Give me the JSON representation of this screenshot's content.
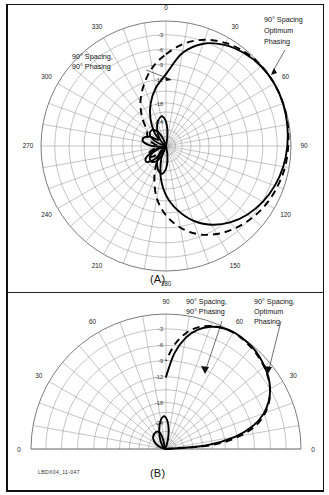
{
  "figure": {
    "id_label": "LBDX04_11-047",
    "panel_a_caption": "(A)",
    "panel_b_caption": "(B)"
  },
  "annotations": {
    "a_left_line1": "90° Spacing,",
    "a_left_line2": "90° Phasing",
    "a_right_line1": "90° Spacing",
    "a_right_line2": "Optimum",
    "a_right_line3": "Phasing",
    "b_left_line1": "90° Spacing,",
    "b_left_line2": "90° Phasing",
    "b_right_line1": "90° Spacing,",
    "b_right_line2": "Optimum",
    "b_right_line3": "Phasing"
  },
  "chart_data": [
    {
      "type": "line",
      "plot_kind": "polar-radiation-pattern",
      "panel": "(A)",
      "title": "",
      "angle_unit": "degrees",
      "angle_ticks": [
        0,
        30,
        60,
        90,
        120,
        150,
        180,
        210,
        240,
        270,
        300,
        330
      ],
      "angle_tick_labels": [
        "0",
        "30",
        "60",
        "90",
        "120",
        "150",
        "180",
        "210",
        "240",
        "270",
        "300",
        "330"
      ],
      "angle_gridline_step": 10,
      "radial_unit": "dB",
      "radial_ticks": [
        -3,
        -6,
        -9,
        -12,
        -18,
        -24
      ],
      "radial_tick_labels": [
        "-3",
        "-6",
        "-9",
        "-12",
        "-18",
        "-24"
      ],
      "radial_max_db": 0,
      "radial_min_db": -40,
      "grid": true,
      "legend_position": "annotations",
      "series": [
        {
          "name": "90° Spacing, 90° Phasing",
          "style": "dashed",
          "description": "Cardioid pattern peaking near 90° azimuth with broad forward lobe and deep rear null",
          "angles_deg": [
            0,
            10,
            20,
            30,
            40,
            50,
            60,
            70,
            80,
            90,
            100,
            110,
            120,
            130,
            140,
            150,
            160,
            170,
            180,
            190,
            200,
            210,
            220,
            230,
            240,
            250,
            260,
            270,
            280,
            290,
            300,
            310,
            320,
            330,
            340,
            350
          ],
          "values_db": [
            -7.0,
            -4.5,
            -2.6,
            -1.3,
            -0.5,
            -0.1,
            0.0,
            -0.1,
            -0.3,
            -0.6,
            -0.9,
            -1.4,
            -2.0,
            -2.8,
            -3.8,
            -5.0,
            -6.6,
            -8.8,
            -11.5,
            -15.5,
            -21.0,
            -27.0,
            -33.0,
            -28.0,
            -26.0,
            -27.5,
            -31.0,
            -33.0,
            -30.0,
            -27.0,
            -25.5,
            -24.0,
            -20.0,
            -16.0,
            -12.5,
            -9.5
          ]
        },
        {
          "name": "90° Spacing Optimum Phasing",
          "style": "solid",
          "description": "Cardioid pattern with slightly narrower forward lobe and sharper rear nulls",
          "angles_deg": [
            0,
            10,
            20,
            30,
            40,
            50,
            60,
            70,
            80,
            90,
            100,
            110,
            120,
            130,
            140,
            150,
            160,
            170,
            180,
            190,
            200,
            210,
            220,
            230,
            240,
            250,
            260,
            270,
            280,
            290,
            300,
            310,
            320,
            330,
            340,
            350
          ],
          "values_db": [
            -11.0,
            -6.5,
            -3.5,
            -1.8,
            -0.8,
            -0.2,
            0.0,
            -0.1,
            -0.4,
            -0.8,
            -1.3,
            -2.0,
            -2.9,
            -4.0,
            -5.4,
            -7.2,
            -9.5,
            -12.5,
            -16.5,
            -22.0,
            -29.0,
            -36.0,
            -28.0,
            -24.0,
            -25.0,
            -30.0,
            -36.0,
            -29.0,
            -25.0,
            -24.5,
            -27.0,
            -32.0,
            -27.0,
            -22.0,
            -17.5,
            -14.0
          ]
        }
      ]
    },
    {
      "type": "line",
      "plot_kind": "polar-elevation-pattern-half",
      "panel": "(B)",
      "title": "",
      "angle_unit": "degrees",
      "angle_span_deg": [
        0,
        180
      ],
      "angle_ticks": [
        0,
        30,
        60,
        90,
        60,
        30,
        0
      ],
      "angle_tick_labels": [
        "0",
        "30",
        "60",
        "90",
        "60",
        "30",
        "0"
      ],
      "angle_gridline_step": 10,
      "radial_unit": "dB",
      "radial_ticks": [
        -3,
        -6,
        -9,
        -12,
        -18,
        -24
      ],
      "radial_tick_labels": [
        "-3",
        "-6",
        "-9",
        "-12",
        "-18",
        "-24"
      ],
      "radial_max_db": 0,
      "radial_min_db": -40,
      "grid": true,
      "legend_position": "annotations",
      "series": [
        {
          "name": "90° Spacing, 90° Phasing",
          "style": "dashed",
          "description": "Elevation lobe rising from horizon on the right, peaking near 55°-65° elevation",
          "elev_deg": [
            0,
            5,
            10,
            15,
            20,
            25,
            30,
            35,
            40,
            45,
            50,
            55,
            60,
            65,
            70,
            75,
            80,
            85,
            90
          ],
          "values_db": [
            -40,
            -18.0,
            -11.5,
            -8.0,
            -5.8,
            -4.2,
            -3.0,
            -2.1,
            -1.4,
            -0.9,
            -0.5,
            -0.2,
            -0.1,
            -0.3,
            -0.8,
            -1.8,
            -3.4,
            -5.8,
            -9.0
          ]
        },
        {
          "name": "90° Spacing, Optimum Phasing",
          "style": "solid",
          "description": "Elevation lobe with similar peak but slightly wider low-angle response",
          "elev_deg": [
            0,
            5,
            10,
            15,
            20,
            25,
            30,
            35,
            40,
            45,
            50,
            55,
            60,
            65,
            70,
            75,
            80,
            85,
            90
          ],
          "values_db": [
            -40,
            -20.0,
            -12.5,
            -8.6,
            -6.1,
            -4.3,
            -3.0,
            -2.0,
            -1.3,
            -0.7,
            -0.3,
            -0.1,
            0.0,
            -0.3,
            -1.0,
            -2.3,
            -4.4,
            -7.6,
            -12.0
          ]
        }
      ]
    }
  ]
}
